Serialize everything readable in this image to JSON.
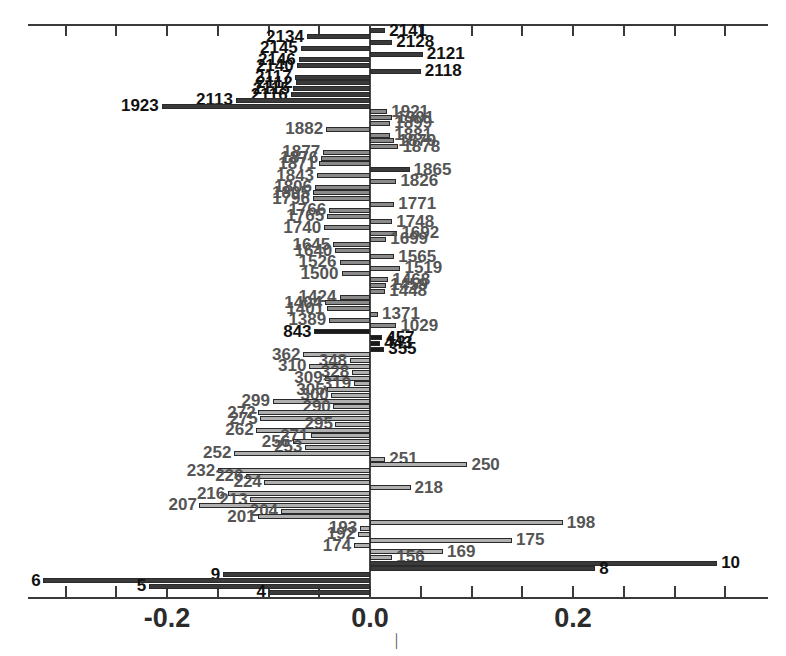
{
  "chart_data": {
    "type": "bar",
    "orientation": "horizontal",
    "title": "",
    "subtitle": "",
    "xlabel": "",
    "ylabel": "",
    "xlim": [
      -0.345,
      0.36
    ],
    "xticks": [
      -0.3,
      -0.25,
      -0.2,
      -0.15,
      -0.1,
      -0.05,
      0.0,
      0.05,
      0.1,
      0.15,
      0.2,
      0.25,
      0.3,
      0.35
    ],
    "xtick_labels": [
      "",
      "",
      "-0.2",
      "",
      "",
      "",
      "0.0",
      "",
      "",
      "",
      "0.2",
      "",
      "",
      ""
    ],
    "grid": false,
    "legend": null,
    "zero_reference": 0.0,
    "note": "Horizontal caterpillar/tornado plot of signed effect values per labeled unit id. Labels sit at the free end of each bar.",
    "categories": [
      "2141",
      "2134",
      "2128",
      "2145",
      "2121",
      "2146",
      "2140",
      "2118",
      "2117",
      "2112",
      "2115",
      "2116",
      "2113",
      "1923",
      "1921",
      "1901",
      "1899",
      "1882",
      "1881",
      "1879",
      "1878",
      "1877",
      "1876",
      "1871",
      "1865",
      "1843",
      "1826",
      "1806",
      "1805",
      "1796",
      "1771",
      "1766",
      "1765",
      "1748",
      "1740",
      "1692",
      "1699",
      "1692b",
      "1645",
      "1640",
      "1565",
      "1526",
      "1519",
      "1500",
      "1468",
      "1459",
      "1448",
      "1424",
      "1404",
      "1401",
      "1371",
      "1389",
      "1029",
      "843",
      "457",
      "443",
      "362",
      "348",
      "310",
      "328",
      "309",
      "319",
      "305",
      "300",
      "299",
      "290",
      "272",
      "275",
      "295",
      "262",
      "271",
      "256",
      "253",
      "252",
      "251",
      "250",
      "232",
      "226",
      "224",
      "218",
      "216",
      "213",
      "207",
      "204",
      "201",
      "198",
      "193",
      "192",
      "175",
      "174",
      "169",
      "156",
      "10",
      "8",
      "9",
      "6",
      "5",
      "4"
    ],
    "values": [
      0.015,
      -0.062,
      0.022,
      -0.068,
      0.052,
      -0.07,
      -0.072,
      0.05,
      -0.075,
      -0.073,
      -0.074,
      -0.076,
      -0.132,
      -0.205,
      0.017,
      0.022,
      0.02,
      -0.043,
      0.02,
      0.024,
      0.028,
      -0.046,
      -0.048,
      -0.05,
      0.039,
      -0.052,
      0.026,
      -0.054,
      -0.056,
      -0.056,
      0.024,
      -0.04,
      -0.042,
      0.022,
      -0.045,
      0.016,
      0.027,
      -0.038,
      -0.036,
      -0.034,
      0.024,
      -0.03,
      0.03,
      -0.028,
      0.018,
      0.016,
      0.015,
      -0.03,
      -0.044,
      -0.042,
      0.008,
      -0.04,
      0.026,
      -0.055,
      0.012,
      0.01,
      -0.066,
      -0.02,
      -0.078,
      -0.018,
      -0.016,
      -0.014,
      -0.015,
      -0.013,
      -0.096,
      -0.012,
      -0.11,
      -0.108,
      -0.011,
      -0.112,
      -0.07,
      -0.076,
      -0.012,
      -0.134,
      0.015,
      0.096,
      -0.15,
      -0.122,
      -0.118,
      0.04,
      -0.14,
      -0.128,
      -0.168,
      -0.088,
      -0.11,
      0.19,
      -0.01,
      -0.012,
      0.14,
      -0.016,
      0.072,
      0.022,
      0.342,
      0.222,
      -0.145,
      -0.322,
      -0.218,
      -0.1
    ],
    "bar_colors": {
      "light": "#b0b0b0",
      "medium": "#8a8a8a",
      "dark": "#3a3a3a",
      "black": "#1a1a1a",
      "outline": "#2a2a2a"
    },
    "label_colors": {
      "default": "#555555",
      "emphasis": "#111111"
    }
  },
  "axis": {
    "tick_labels": [
      {
        "text": "-0.2",
        "value": -0.2
      },
      {
        "text": "0.0",
        "value": 0.0
      },
      {
        "text": "0.2",
        "value": 0.2
      }
    ]
  },
  "rows": [
    {
      "label": "2141",
      "value": 0.015,
      "shade": "dark",
      "emph": true
    },
    {
      "label": "2134",
      "value": -0.062,
      "shade": "dark",
      "emph": true
    },
    {
      "label": "2128",
      "value": 0.022,
      "shade": "dark",
      "emph": true
    },
    {
      "label": "2145",
      "value": -0.068,
      "shade": "dark",
      "emph": true
    },
    {
      "label": "2121",
      "value": 0.052,
      "shade": "dark",
      "emph": true
    },
    {
      "label": "2146",
      "value": -0.07,
      "shade": "dark",
      "emph": true
    },
    {
      "label": "2140",
      "value": -0.072,
      "shade": "dark",
      "emph": true
    },
    {
      "label": "2118",
      "value": 0.05,
      "shade": "dark",
      "emph": true
    },
    {
      "label": "2117",
      "value": -0.074,
      "shade": "dark",
      "emph": true
    },
    {
      "label": "2112",
      "value": -0.073,
      "shade": "dark",
      "emph": true
    },
    {
      "label": "2115",
      "value": -0.076,
      "shade": "dark",
      "emph": true
    },
    {
      "label": "2116",
      "value": -0.078,
      "shade": "dark",
      "emph": true
    },
    {
      "label": "2113",
      "value": -0.132,
      "shade": "dark",
      "emph": true
    },
    {
      "label": "1923",
      "value": -0.205,
      "shade": "dark",
      "emph": true
    },
    {
      "label": "1921",
      "value": 0.017,
      "shade": "medium",
      "emph": false
    },
    {
      "label": "1901",
      "value": 0.022,
      "shade": "medium",
      "emph": false
    },
    {
      "label": "1899",
      "value": 0.02,
      "shade": "medium",
      "emph": false
    },
    {
      "label": "1882",
      "value": -0.043,
      "shade": "medium",
      "emph": false
    },
    {
      "label": "1881",
      "value": 0.02,
      "shade": "medium",
      "emph": false
    },
    {
      "label": "1879",
      "value": 0.024,
      "shade": "medium",
      "emph": false
    },
    {
      "label": "1878",
      "value": 0.028,
      "shade": "medium",
      "emph": false
    },
    {
      "label": "1877",
      "value": -0.046,
      "shade": "medium",
      "emph": false
    },
    {
      "label": "1876",
      "value": -0.048,
      "shade": "medium",
      "emph": false
    },
    {
      "label": "1871",
      "value": -0.05,
      "shade": "medium",
      "emph": false
    },
    {
      "label": "1865",
      "value": 0.039,
      "shade": "dark",
      "emph": false
    },
    {
      "label": "1843",
      "value": -0.052,
      "shade": "medium",
      "emph": false
    },
    {
      "label": "1826",
      "value": 0.026,
      "shade": "medium",
      "emph": false
    },
    {
      "label": "1806",
      "value": -0.054,
      "shade": "medium",
      "emph": false
    },
    {
      "label": "1805",
      "value": -0.056,
      "shade": "medium",
      "emph": false
    },
    {
      "label": "1796",
      "value": -0.056,
      "shade": "medium",
      "emph": false
    },
    {
      "label": "1771",
      "value": 0.024,
      "shade": "medium",
      "emph": false
    },
    {
      "label": "1766",
      "value": -0.04,
      "shade": "medium",
      "emph": false
    },
    {
      "label": "1765",
      "value": -0.042,
      "shade": "medium",
      "emph": false
    },
    {
      "label": "1748",
      "value": 0.022,
      "shade": "medium",
      "emph": false
    },
    {
      "label": "1740",
      "value": -0.045,
      "shade": "medium",
      "emph": false
    },
    {
      "label": "1692",
      "value": 0.027,
      "shade": "medium",
      "emph": false
    },
    {
      "label": "1699",
      "value": 0.016,
      "shade": "medium",
      "emph": false
    },
    {
      "label": "1645",
      "value": -0.036,
      "shade": "medium",
      "emph": false
    },
    {
      "label": "1640",
      "value": -0.034,
      "shade": "medium",
      "emph": false
    },
    {
      "label": "1565",
      "value": 0.024,
      "shade": "medium",
      "emph": false
    },
    {
      "label": "1526",
      "value": -0.03,
      "shade": "medium",
      "emph": false
    },
    {
      "label": "1519",
      "value": 0.03,
      "shade": "medium",
      "emph": false
    },
    {
      "label": "1500",
      "value": -0.028,
      "shade": "medium",
      "emph": false
    },
    {
      "label": "1468",
      "value": 0.018,
      "shade": "medium",
      "emph": false
    },
    {
      "label": "1459",
      "value": 0.016,
      "shade": "medium",
      "emph": false
    },
    {
      "label": "1448",
      "value": 0.015,
      "shade": "medium",
      "emph": false
    },
    {
      "label": "1424",
      "value": -0.03,
      "shade": "medium",
      "emph": false
    },
    {
      "label": "1404",
      "value": -0.044,
      "shade": "medium",
      "emph": false
    },
    {
      "label": "1401",
      "value": -0.042,
      "shade": "medium",
      "emph": false
    },
    {
      "label": "1371",
      "value": 0.008,
      "shade": "medium",
      "emph": false
    },
    {
      "label": "1389",
      "value": -0.04,
      "shade": "medium",
      "emph": false
    },
    {
      "label": "1029",
      "value": 0.026,
      "shade": "medium",
      "emph": false
    },
    {
      "label": "843",
      "value": -0.055,
      "shade": "black",
      "emph": true
    },
    {
      "label": "457",
      "value": 0.012,
      "shade": "black",
      "emph": true
    },
    {
      "label": "443",
      "value": 0.01,
      "shade": "black",
      "emph": true
    },
    {
      "label": "355",
      "value": 0.014,
      "shade": "black",
      "emph": true
    },
    {
      "label": "362",
      "value": -0.066,
      "shade": "light",
      "emph": false
    },
    {
      "label": "348",
      "value": -0.02,
      "shade": "light",
      "emph": false
    },
    {
      "label": "310",
      "value": -0.06,
      "shade": "light",
      "emph": false
    },
    {
      "label": "328",
      "value": -0.018,
      "shade": "light",
      "emph": false
    },
    {
      "label": "309",
      "value": -0.044,
      "shade": "light",
      "emph": false
    },
    {
      "label": "319",
      "value": -0.016,
      "shade": "light",
      "emph": false
    },
    {
      "label": "305",
      "value": -0.042,
      "shade": "light",
      "emph": false
    },
    {
      "label": "300",
      "value": -0.038,
      "shade": "light",
      "emph": false
    },
    {
      "label": "299",
      "value": -0.096,
      "shade": "light",
      "emph": false
    },
    {
      "label": "290",
      "value": -0.036,
      "shade": "light",
      "emph": false
    },
    {
      "label": "272",
      "value": -0.11,
      "shade": "light",
      "emph": false
    },
    {
      "label": "275",
      "value": -0.108,
      "shade": "light",
      "emph": false
    },
    {
      "label": "295",
      "value": -0.034,
      "shade": "light",
      "emph": false
    },
    {
      "label": "262",
      "value": -0.112,
      "shade": "light",
      "emph": false
    },
    {
      "label": "271",
      "value": -0.058,
      "shade": "light",
      "emph": false
    },
    {
      "label": "256",
      "value": -0.076,
      "shade": "light",
      "emph": false
    },
    {
      "label": "253",
      "value": -0.064,
      "shade": "light",
      "emph": false
    },
    {
      "label": "252",
      "value": -0.134,
      "shade": "light",
      "emph": false
    },
    {
      "label": "251",
      "value": 0.015,
      "shade": "light",
      "emph": false
    },
    {
      "label": "250",
      "value": 0.096,
      "shade": "light",
      "emph": false
    },
    {
      "label": "232",
      "value": -0.15,
      "shade": "light",
      "emph": false
    },
    {
      "label": "226",
      "value": -0.122,
      "shade": "light",
      "emph": false
    },
    {
      "label": "224",
      "value": -0.104,
      "shade": "light",
      "emph": false
    },
    {
      "label": "218",
      "value": 0.04,
      "shade": "light",
      "emph": false
    },
    {
      "label": "216",
      "value": -0.14,
      "shade": "light",
      "emph": false
    },
    {
      "label": "213",
      "value": -0.118,
      "shade": "light",
      "emph": false
    },
    {
      "label": "207",
      "value": -0.168,
      "shade": "light",
      "emph": false
    },
    {
      "label": "204",
      "value": -0.088,
      "shade": "light",
      "emph": false
    },
    {
      "label": "201",
      "value": -0.11,
      "shade": "light",
      "emph": false
    },
    {
      "label": "198",
      "value": 0.19,
      "shade": "light",
      "emph": false
    },
    {
      "label": "193",
      "value": -0.01,
      "shade": "light",
      "emph": false
    },
    {
      "label": "192",
      "value": -0.012,
      "shade": "light",
      "emph": false
    },
    {
      "label": "175",
      "value": 0.14,
      "shade": "light",
      "emph": false
    },
    {
      "label": "174",
      "value": -0.016,
      "shade": "light",
      "emph": false
    },
    {
      "label": "169",
      "value": 0.072,
      "shade": "light",
      "emph": false
    },
    {
      "label": "156",
      "value": 0.022,
      "shade": "light",
      "emph": false
    },
    {
      "label": "10",
      "value": 0.342,
      "shade": "dark",
      "emph": true
    },
    {
      "label": "8",
      "value": 0.222,
      "shade": "dark",
      "emph": true
    },
    {
      "label": "9",
      "value": -0.145,
      "shade": "dark",
      "emph": true
    },
    {
      "label": "6",
      "value": -0.322,
      "shade": "dark",
      "emph": true
    },
    {
      "label": "5",
      "value": -0.218,
      "shade": "dark",
      "emph": true
    },
    {
      "label": "4",
      "value": -0.1,
      "shade": "dark",
      "emph": true
    }
  ]
}
